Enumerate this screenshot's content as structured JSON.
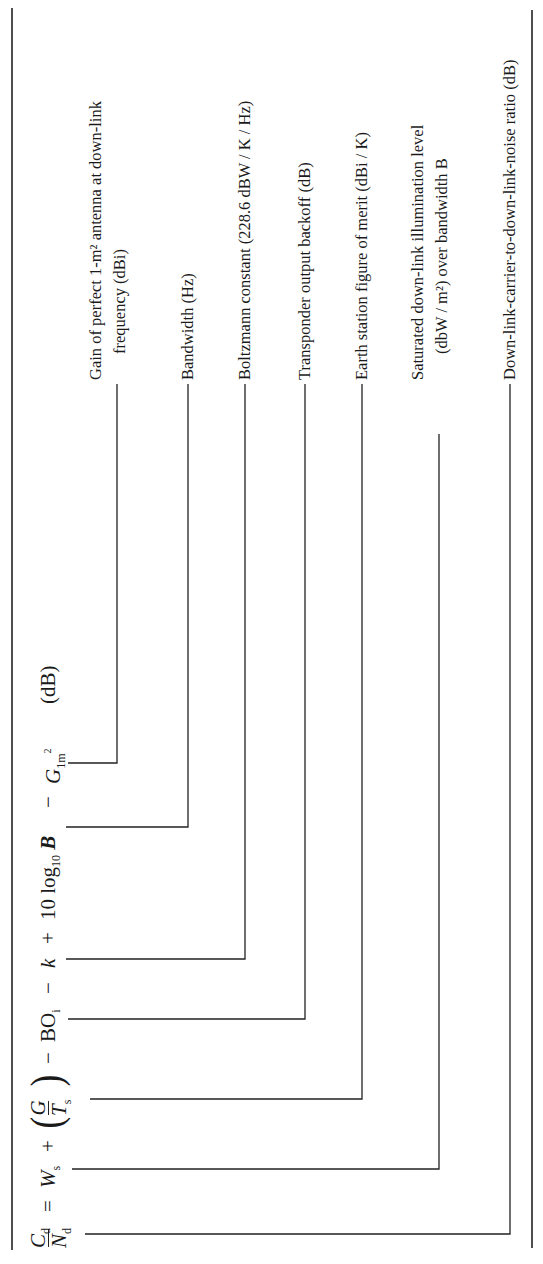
{
  "equation": {
    "lhs": {
      "numerator": "C",
      "numerator_sub": "d",
      "denominator": "N",
      "denominator_sub": "d"
    },
    "equals": "=",
    "terms": [
      {
        "id": "Ws",
        "symbol": "W",
        "sub": "s",
        "operator_before": ""
      },
      {
        "id": "G_over_Ts",
        "numerator": "G",
        "denominator": "T",
        "denominator_sub": "s",
        "operator_before": "+"
      },
      {
        "id": "BOi",
        "symbol": "BO",
        "sub": "i",
        "operator_before": "−"
      },
      {
        "id": "k",
        "symbol": "k",
        "operator_before": "−"
      },
      {
        "id": "B",
        "prefix": "10 log",
        "prefix_sub": "10",
        "symbol": "B",
        "operator_before": "+"
      },
      {
        "id": "G1m2",
        "symbol": "G",
        "sub": "1m",
        "sub_sup": "2",
        "operator_before": "−"
      }
    ],
    "unit": "(dB)"
  },
  "annotations": [
    {
      "term": "G1m2",
      "lines": [
        "Gain of perfect 1-m² antenna at down-link",
        "frequency (dBi)"
      ]
    },
    {
      "term": "B",
      "lines": [
        "Bandwidth (Hz)"
      ]
    },
    {
      "term": "k",
      "lines": [
        "Boltzmann constant (228.6 dBW / K / Hz)"
      ]
    },
    {
      "term": "BOi",
      "lines": [
        "Transponder output backoff (dB)"
      ]
    },
    {
      "term": "G_over_Ts",
      "lines": [
        "Earth station figure of merit (dBi / K)"
      ]
    },
    {
      "term": "Ws",
      "lines": [
        "Saturated down-link illumination level",
        "(dbW / m²) over bandwidth B"
      ]
    },
    {
      "term": "Cd_Nd",
      "lines": [
        "Down-link-carrier-to-down-link-noise ratio (dB)"
      ]
    }
  ]
}
